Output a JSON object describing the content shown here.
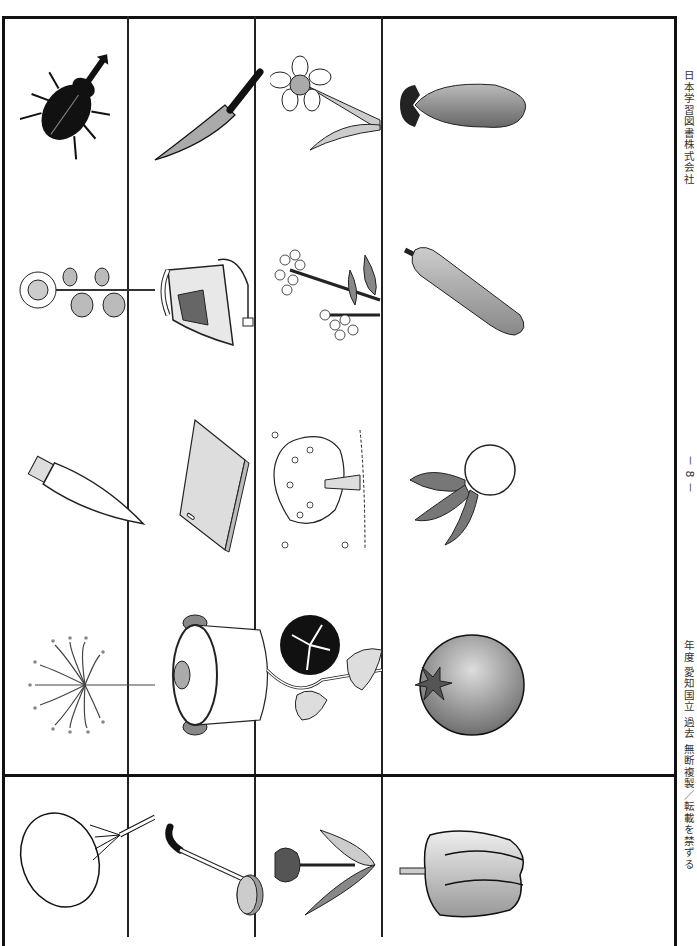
{
  "document": {
    "publisher": "日本学習図書株式会社",
    "page_number": "－ 8 －",
    "footer_notice": "年度 愛知国立 過去 無断複製／転載を禁ずる"
  },
  "grid": {
    "columns": [
      {
        "items": [
          {
            "name": "rhinoceros-beetle",
            "label": "カブトムシ"
          },
          {
            "name": "sunflower",
            "label": "ヒマワリ"
          },
          {
            "name": "daikon-radish",
            "label": "ダイコン"
          },
          {
            "name": "sparkler",
            "label": "線香花火"
          }
        ]
      },
      {
        "items": [
          {
            "name": "kitchen-knife",
            "label": "包丁"
          },
          {
            "name": "iron",
            "label": "アイロン"
          },
          {
            "name": "cutting-board",
            "label": "まな板"
          },
          {
            "name": "pot",
            "label": "鍋"
          }
        ]
      },
      {
        "items": [
          {
            "name": "daffodil",
            "label": "スイセン"
          },
          {
            "name": "rapeseed-flower",
            "label": "菜の花"
          },
          {
            "name": "cherry-tree",
            "label": "桜"
          },
          {
            "name": "morning-glory",
            "label": "アサガオ"
          }
        ]
      },
      {
        "items": [
          {
            "name": "eggplant",
            "label": "ナス"
          },
          {
            "name": "cucumber",
            "label": "キュウリ"
          },
          {
            "name": "turnip",
            "label": "カブ"
          },
          {
            "name": "tomato",
            "label": "トマト"
          }
        ]
      }
    ],
    "answer_row": [
      {
        "name": "paper-fan",
        "label": "うちわ"
      },
      {
        "name": "ladle",
        "label": "おたま"
      },
      {
        "name": "tulip",
        "label": "チューリップ"
      },
      {
        "name": "bell-pepper",
        "label": "ピーマン"
      }
    ]
  }
}
